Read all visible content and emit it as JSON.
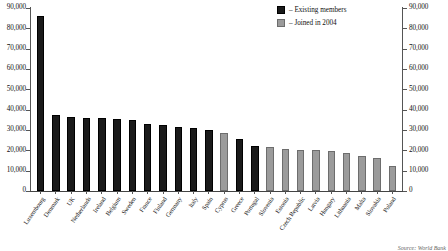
{
  "chart_data": {
    "type": "bar",
    "title": "",
    "xlabel": "",
    "ylabel": "",
    "ylim": [
      0,
      90000
    ],
    "grid": false,
    "legend_position": "top-right",
    "y_ticks": [
      "0",
      "10,000",
      "20,000",
      "30,000",
      "40,000",
      "50,000",
      "60,000",
      "70,000",
      "80,000",
      "90,000"
    ],
    "y_tick_values": [
      0,
      10000,
      20000,
      30000,
      40000,
      50000,
      60000,
      70000,
      80000,
      90000
    ],
    "categories": [
      "Luxembourg",
      "Denmark",
      "UK",
      "Netherlands",
      "Ireland",
      "Belgium",
      "Sweden",
      "France",
      "Finland",
      "Germany",
      "Italy",
      "Spain",
      "Cyprus",
      "Greece",
      "Portugal",
      "Slovenia",
      "Estonia",
      "Czech Republic",
      "Latvia",
      "Hungary",
      "Lithuania",
      "Malta",
      "Slovakia",
      "Poland"
    ],
    "values": [
      86000,
      37500,
      36500,
      36000,
      36000,
      35500,
      35000,
      33000,
      32500,
      31500,
      31000,
      30000,
      28500,
      25500,
      22000,
      21500,
      20500,
      20000,
      20000,
      19500,
      18500,
      17000,
      16000,
      12500
    ],
    "series": [
      {
        "name": "Existing members",
        "color": "#1a1a1a",
        "members": [
          "Luxembourg",
          "Denmark",
          "UK",
          "Netherlands",
          "Ireland",
          "Belgium",
          "Sweden",
          "France",
          "Finland",
          "Germany",
          "Italy",
          "Spain",
          "Greece",
          "Portugal"
        ]
      },
      {
        "name": "Joined in 2004",
        "color": "#9b9b9b",
        "members": [
          "Cyprus",
          "Slovenia",
          "Estonia",
          "Czech Republic",
          "Latvia",
          "Hungary",
          "Lithuania",
          "Malta",
          "Slovakia",
          "Poland"
        ]
      }
    ],
    "bars": [
      {
        "label": "Luxembourg",
        "value": 86000,
        "group": "existing"
      },
      {
        "label": "Denmark",
        "value": 37500,
        "group": "existing"
      },
      {
        "label": "UK",
        "value": 36500,
        "group": "existing"
      },
      {
        "label": "Netherlands",
        "value": 36000,
        "group": "existing"
      },
      {
        "label": "Ireland",
        "value": 36000,
        "group": "existing"
      },
      {
        "label": "Belgium",
        "value": 35500,
        "group": "existing"
      },
      {
        "label": "Sweden",
        "value": 35000,
        "group": "existing"
      },
      {
        "label": "France",
        "value": 33000,
        "group": "existing"
      },
      {
        "label": "Finland",
        "value": 32500,
        "group": "existing"
      },
      {
        "label": "Germany",
        "value": 31500,
        "group": "existing"
      },
      {
        "label": "Italy",
        "value": 31000,
        "group": "existing"
      },
      {
        "label": "Spain",
        "value": 30000,
        "group": "existing"
      },
      {
        "label": "Cyprus",
        "value": 28500,
        "group": "joined"
      },
      {
        "label": "Greece",
        "value": 25500,
        "group": "existing"
      },
      {
        "label": "Portugal",
        "value": 22000,
        "group": "existing"
      },
      {
        "label": "Slovenia",
        "value": 21500,
        "group": "joined"
      },
      {
        "label": "Estonia",
        "value": 20500,
        "group": "joined"
      },
      {
        "label": "Czech Republic",
        "value": 20000,
        "group": "joined"
      },
      {
        "label": "Latvia",
        "value": 20000,
        "group": "joined"
      },
      {
        "label": "Hungary",
        "value": 19500,
        "group": "joined"
      },
      {
        "label": "Lithuania",
        "value": 18500,
        "group": "joined"
      },
      {
        "label": "Malta",
        "value": 17000,
        "group": "joined"
      },
      {
        "label": "Slovakia",
        "value": 16000,
        "group": "joined"
      },
      {
        "label": "Poland",
        "value": 12500,
        "group": "joined"
      }
    ]
  },
  "legend": {
    "items": [
      {
        "label": "– Existing members",
        "group": "existing"
      },
      {
        "label": "– Joined in 2004",
        "group": "joined"
      }
    ]
  },
  "source": {
    "text": "Source: World Bank"
  }
}
